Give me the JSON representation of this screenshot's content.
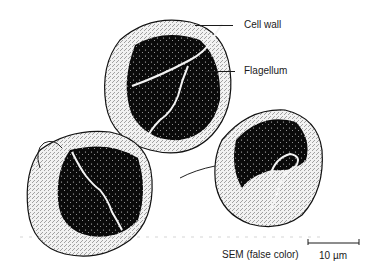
{
  "figure": {
    "type": "SEM micrograph",
    "cells_count": 3,
    "labels": {
      "cell_wall": "Cell wall",
      "flagellum": "Flagellum",
      "caption": "SEM (false color)",
      "scale_bar": "10 µm"
    },
    "colors": {
      "cell_dark": "#0a0a0a",
      "cell_surface": "#e8e8e8",
      "background": "#ffffff",
      "line": "#1a1a1a"
    }
  }
}
